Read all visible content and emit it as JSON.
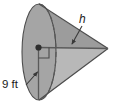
{
  "figure": {
    "name": "cone-diagram",
    "shape": "cone",
    "colors": {
      "base_fill": "#a3a3a3",
      "body_fill_upper": "#9a9a9a",
      "body_fill_lower": "#b4b4b4",
      "outline": "#4d4d4d",
      "hidden_edge": "#5a5a5a",
      "leader_line": "#3a3a3a",
      "text": "#1a1a1a",
      "background": "#ffffff"
    },
    "labels": {
      "radius": "9 ft",
      "height": "h"
    },
    "annotations": {
      "center_point": "center-dot",
      "right_angle": "right-angle-marker",
      "hidden_ellipse_half": "dashed-arc",
      "radius_leader": "arrow pointing up-right to radius segment",
      "height_leader": "arrow pointing down-left to axis segment"
    },
    "measurements": {
      "radius_value": 9,
      "radius_unit": "ft",
      "height_value": "h",
      "height_unit": ""
    }
  }
}
